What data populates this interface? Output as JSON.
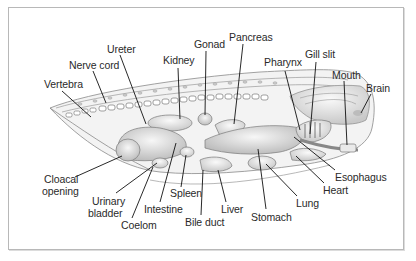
{
  "figure": {
    "colors": {
      "frame": "#b8b8b8",
      "line": "#1a1a1a",
      "organ_fill": "#d9d9d9",
      "body_fill": "#eeeeee",
      "text": "#2a2a2a"
    }
  },
  "labels": {
    "ureter": "Ureter",
    "nerve_cord": "Nerve cord",
    "vertebra": "Vertebra",
    "kidney": "Kidney",
    "gonad": "Gonad",
    "pancreas": "Pancreas",
    "pharynx": "Pharynx",
    "gill_slit": "Gill slit",
    "mouth": "Mouth",
    "brain": "Brain",
    "cloacal_opening_1": "Cloacal",
    "cloacal_opening_2": "opening",
    "urinary_bladder_1": "Urinary",
    "urinary_bladder_2": "bladder",
    "coelom": "Coelom",
    "intestine": "Intestine",
    "spleen": "Spleen",
    "bile_duct": "Bile duct",
    "liver": "Liver",
    "stomach": "Stomach",
    "lung": "Lung",
    "heart": "Heart",
    "esophagus": "Esophagus"
  }
}
